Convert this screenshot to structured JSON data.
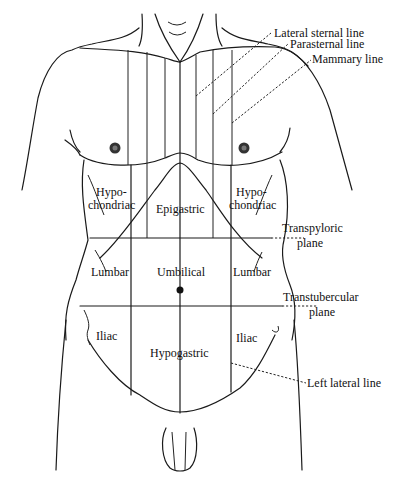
{
  "diagram": {
    "regions": {
      "hypochondriac_right": [
        "Hypo-",
        "chondriac"
      ],
      "hypochondriac_left": [
        "Hypo-",
        "chondriac"
      ],
      "epigastric": "Epigastric",
      "lumbar_right": "Lumbar",
      "umbilical": "Umbilical",
      "lumbar_left": "Lumbar",
      "iliac_right": "Iliac",
      "hypogastric": "Hypogastric",
      "iliac_left": "Iliac"
    },
    "reference_lines": {
      "lateral_sternal": "Lateral sternal line",
      "parasternal": "Parasternal line",
      "mammary": "Mammary line",
      "transpyloric": [
        "Transpyloric",
        "plane"
      ],
      "transtubercular": [
        "Transtubercular",
        "plane"
      ],
      "left_lateral": "Left lateral line"
    }
  }
}
